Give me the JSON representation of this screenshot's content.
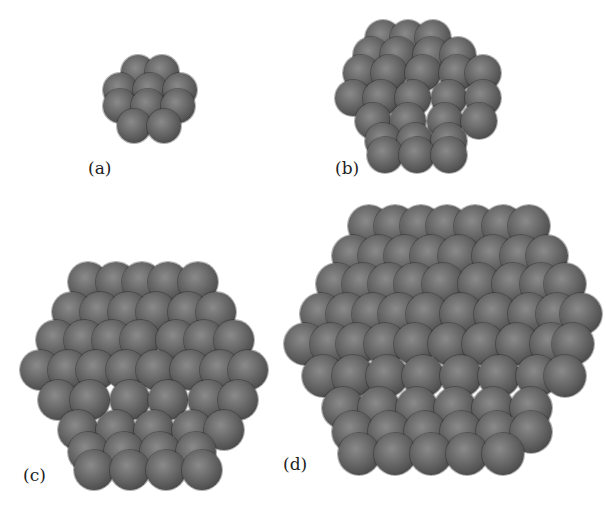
{
  "figure": {
    "background": "#ffffff",
    "atom_color": "#5a5a5a",
    "panels": [
      {
        "id": "a",
        "label": "(a)",
        "box": {
          "left": 95,
          "top": 55,
          "width": 115,
          "height": 120
        },
        "label_pos": {
          "left": 88,
          "top": 160
        },
        "atom_diameter": 34,
        "rows": [
          {
            "y": 0,
            "xs": [
              26,
              50
            ]
          },
          {
            "y": 18,
            "xs": [
              8,
              38,
              68
            ]
          },
          {
            "y": 34,
            "xs": [
              8,
              36,
              66
            ]
          },
          {
            "y": 54,
            "xs": [
              22,
              52
            ]
          }
        ]
      },
      {
        "id": "b",
        "label": "(b)",
        "box": {
          "left": 335,
          "top": 15,
          "width": 170,
          "height": 165
        },
        "label_pos": {
          "left": 335,
          "top": 160
        },
        "atom_diameter": 36,
        "rows": [
          {
            "y": 5,
            "xs": [
              30,
              55,
              80
            ]
          },
          {
            "y": 22,
            "xs": [
              18,
              45,
              78,
              105
            ]
          },
          {
            "y": 40,
            "xs": [
              8,
              36,
              70,
              104,
              130
            ]
          },
          {
            "y": 65,
            "xs": [
              0,
              28,
              60,
              96,
              130
            ]
          },
          {
            "y": 88,
            "xs": [
              20,
              55,
              92,
              126
            ]
          },
          {
            "y": 108,
            "xs": [
              30,
              62,
              96
            ]
          },
          {
            "y": 122,
            "xs": [
              32,
              64,
              96
            ]
          }
        ]
      },
      {
        "id": "c",
        "label": "(c)",
        "box": {
          "left": 18,
          "top": 262,
          "width": 236,
          "height": 225
        },
        "label_pos": {
          "left": 23,
          "top": 467
        },
        "atom_diameter": 40,
        "rows": [
          {
            "y": 0,
            "xs": [
              50,
              78,
              104,
              130,
              160
            ]
          },
          {
            "y": 30,
            "xs": [
              34,
              62,
              90,
              118,
              150,
              178
            ]
          },
          {
            "y": 58,
            "xs": [
              18,
              46,
              74,
              102,
              138,
              166,
              196
            ]
          },
          {
            "y": 88,
            "xs": [
              2,
              30,
              58,
              88,
              118,
              152,
              182,
              210
            ]
          },
          {
            "y": 118,
            "xs": [
              20,
              52,
              92,
              130,
              170,
              200
            ]
          },
          {
            "y": 148,
            "xs": [
              40,
              78,
              116,
              154,
              186
            ]
          },
          {
            "y": 170,
            "xs": [
              50,
              86,
              122,
              158
            ]
          },
          {
            "y": 188,
            "xs": [
              56,
              92,
              128,
              164
            ]
          }
        ]
      },
      {
        "id": "d",
        "label": "(d)",
        "box": {
          "left": 282,
          "top": 205,
          "width": 312,
          "height": 290
        },
        "label_pos": {
          "left": 283,
          "top": 456
        },
        "atom_diameter": 42,
        "rows": [
          {
            "y": 0,
            "xs": [
              66,
              92,
              118,
              144,
              172,
              200,
              226
            ]
          },
          {
            "y": 30,
            "xs": [
              50,
              76,
              102,
              128,
              156,
              190,
              218,
              244
            ]
          },
          {
            "y": 58,
            "xs": [
              34,
              60,
              86,
              112,
              140,
              176,
              210,
              238,
              262
            ]
          },
          {
            "y": 88,
            "xs": [
              18,
              44,
              70,
              96,
              124,
              158,
              192,
              226,
              254,
              278
            ]
          },
          {
            "y": 118,
            "xs": [
              2,
              28,
              54,
              82,
              112,
              146,
              180,
              214,
              248,
              270
            ]
          },
          {
            "y": 150,
            "xs": [
              20,
              50,
              84,
              120,
              158,
              196,
              234,
              262
            ]
          },
          {
            "y": 182,
            "xs": [
              40,
              76,
              114,
              152,
              190,
              228
            ]
          },
          {
            "y": 206,
            "xs": [
              50,
              86,
              122,
              158,
              194,
              228
            ]
          },
          {
            "y": 228,
            "xs": [
              56,
              92,
              128,
              164,
              200
            ]
          }
        ]
      }
    ]
  }
}
